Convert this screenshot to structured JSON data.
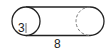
{
  "diagram": {
    "shape": "cylinder",
    "orientation": "horizontal",
    "labels": {
      "radius": "3",
      "length": "8"
    },
    "colors": {
      "stroke": "#222222",
      "hidden_edge": "#777777",
      "background": "#ffffff"
    }
  }
}
